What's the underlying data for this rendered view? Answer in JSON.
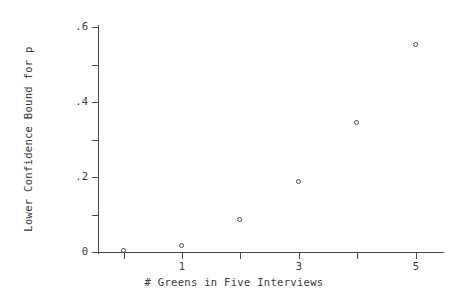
{
  "chart_data": {
    "type": "scatter",
    "title": "",
    "xlabel": "# Greens in Five Interviews",
    "ylabel": "Lower Confidence Bound for p",
    "x": [
      0,
      1,
      2,
      3,
      4,
      5
    ],
    "values": [
      0.002,
      0.015,
      0.086,
      0.188,
      0.345,
      0.552
    ],
    "series": [
      {
        "name": "Lower Confidence Bound",
        "points": [
          {
            "x": 0,
            "y": 0.002
          },
          {
            "x": 1,
            "y": 0.015
          },
          {
            "x": 2,
            "y": 0.086
          },
          {
            "x": 3,
            "y": 0.188
          },
          {
            "x": 4,
            "y": 0.345
          },
          {
            "x": 5,
            "y": 0.552
          }
        ]
      }
    ],
    "xlim": [
      -0.42,
      5.43
    ],
    "ylim": [
      0.0,
      0.6
    ],
    "xticks": [
      0,
      1,
      2,
      3,
      4,
      5
    ],
    "xtick_labels": [
      "",
      "1",
      "",
      "3",
      "",
      "5"
    ],
    "yticks": [
      0.0,
      0.1,
      0.2,
      0.3,
      0.4,
      0.5,
      0.6
    ],
    "ytick_labels": [
      "0",
      "",
      ".2",
      "",
      ".4",
      "",
      ".6"
    ],
    "grid": false,
    "legend": false,
    "marker": "open-circle",
    "marker_color": "#4a4a4a",
    "axis_color": "#4a4a4a",
    "background": "#ffffff"
  }
}
